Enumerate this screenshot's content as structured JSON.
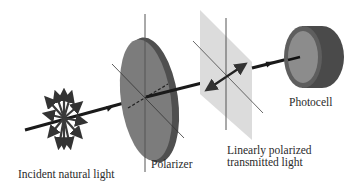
{
  "diagram": {
    "labels": {
      "incident": "Incident natural light",
      "polarizer": "Polarizer",
      "transmitted_line1": "Linearly polarized",
      "transmitted_line2": "transmitted light",
      "photocell": "Photocell"
    },
    "components": [
      "incident-natural-light",
      "polarizer-disk",
      "polarization-plane",
      "photocell"
    ],
    "colors": {
      "beam": "#1a1a1a",
      "polarizer_face": "#7a7a7a",
      "polarizer_edge": "#4a4a4a",
      "plane": "#dcdcdc",
      "photocell_body": "#555555",
      "photocell_face": "#8a8a8a",
      "axis_lines": "#444444"
    }
  }
}
